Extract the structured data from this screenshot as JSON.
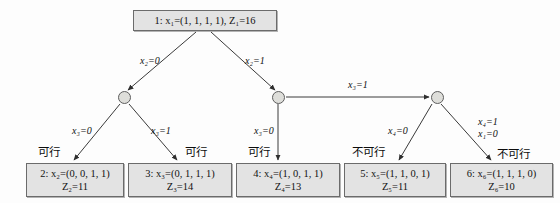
{
  "diagram": {
    "root": {
      "id": "node-1",
      "line1": "1: x₁=(1, 1, 1, 1),  Z₁=16",
      "line2": ""
    },
    "leaves": [
      {
        "id": "node-2",
        "line1": "2: x₂=(0, 0, 1, 1)",
        "line2": "Z₂=11",
        "status": "可行"
      },
      {
        "id": "node-3",
        "line1": "3: x₃=(0, 1, 1, 1)",
        "line2": "Z₃=14",
        "status": "可行"
      },
      {
        "id": "node-4",
        "line1": "4: x₄=(1, 0, 1, 1)",
        "line2": "Z₄=13",
        "status": "可行"
      },
      {
        "id": "node-5",
        "line1": "5: x₅=(1, 1, 0, 1)",
        "line2": "Z₅=11",
        "status": "不可行"
      },
      {
        "id": "node-6",
        "line1": "6: x₆=(1, 1, 1, 0)",
        "line2": "Z₆=10",
        "status": "不可行"
      }
    ],
    "edge_labels": {
      "root_left": "x₂=0",
      "root_right": "x₂=1",
      "mid_to_right": "x₃=1",
      "left_branch_0": "x₃=0",
      "left_branch_1": "x₃=1",
      "mid_down": "x₃=0",
      "right_branch_0": "x₄=0",
      "right_branch_1a": "x₄=1",
      "right_branch_1b": "x₁=0"
    },
    "status_labels": {
      "feasible": "可行",
      "infeasible": "不可行"
    },
    "colors": {
      "box_fill": "#e3e3e3",
      "box_border": "#6b6b6b",
      "circle_fill": "#dededa",
      "edge": "#3a3a3a",
      "background": "#fdfdfd"
    }
  }
}
